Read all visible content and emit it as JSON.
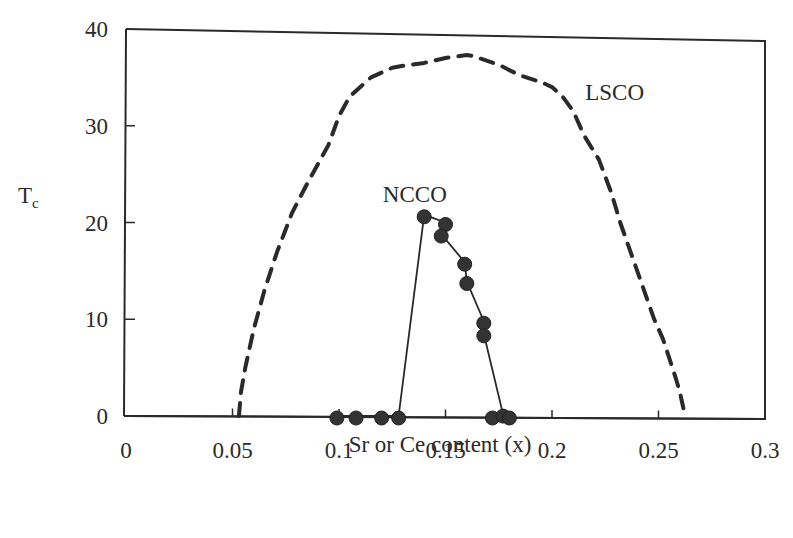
{
  "chart_data": {
    "type": "line",
    "title": "",
    "xlabel": "Sr or Ce content (x)",
    "ylabel": "Tc",
    "ylabel_main": "T",
    "ylabel_sub": "c",
    "xlim": [
      0,
      0.3
    ],
    "ylim": [
      0,
      40
    ],
    "xticks": [
      0,
      0.05,
      0.1,
      0.15,
      0.2,
      0.25,
      0.3
    ],
    "xtick_labels": [
      "0",
      "0.05",
      "0.1",
      "0.15",
      "0.2",
      "0.25",
      "0.3"
    ],
    "yticks": [
      0,
      10,
      20,
      30,
      40
    ],
    "ytick_labels": [
      "0",
      "10",
      "20",
      "30",
      "40"
    ],
    "grid": false,
    "legend": "none (inline labels)",
    "series": [
      {
        "name": "LSCO",
        "style": "dashed",
        "markers": false,
        "label_position": {
          "x": 0.225,
          "y": 33.5
        },
        "x": [
          0.053,
          0.054,
          0.056,
          0.06,
          0.065,
          0.071,
          0.078,
          0.085,
          0.095,
          0.1,
          0.105,
          0.115,
          0.125,
          0.13,
          0.14,
          0.15,
          0.16,
          0.163,
          0.175,
          0.185,
          0.195,
          0.2,
          0.205,
          0.21,
          0.215,
          0.222,
          0.228,
          0.232,
          0.236,
          0.24,
          0.244,
          0.248,
          0.252,
          0.255,
          0.258,
          0.26,
          0.261,
          0.262
        ],
        "y": [
          0,
          2.5,
          5,
          9,
          13,
          17,
          21,
          24,
          28,
          31,
          33,
          35,
          36,
          36.2,
          36.5,
          37,
          37.3,
          37.2,
          36.3,
          35.2,
          34.5,
          34,
          33,
          31.5,
          29,
          26.5,
          23,
          20,
          17.5,
          15,
          12.5,
          10,
          8,
          6,
          4,
          2.5,
          1.5,
          0.5
        ]
      },
      {
        "name": "NCCO",
        "style": "solid",
        "markers": true,
        "marker": "filled-circle",
        "label_position": {
          "x": 0.122,
          "y": 22.3
        },
        "x": [
          0.099,
          0.108,
          0.12,
          0.128,
          0.14,
          0.15,
          0.148,
          0.159,
          0.16,
          0.168,
          0.168,
          0.172,
          0.177,
          0.18
        ],
        "y": [
          0,
          0,
          0,
          0,
          20.8,
          20,
          18.8,
          15.9,
          13.9,
          9.8,
          8.5,
          0,
          0.2,
          0
        ],
        "line_path_order": [
          [
            0.099,
            0
          ],
          [
            0.128,
            0
          ],
          [
            0.14,
            20.8
          ],
          [
            0.15,
            20
          ],
          [
            0.148,
            18.8
          ],
          [
            0.159,
            15.9
          ],
          [
            0.16,
            13.9
          ],
          [
            0.168,
            9.8
          ],
          [
            0.168,
            8.5
          ],
          [
            0.177,
            0.2
          ],
          [
            0.18,
            0
          ]
        ]
      }
    ],
    "colors": {
      "ink": "#2a2a2a",
      "marker_fill": "#333333",
      "background": "#ffffff"
    }
  }
}
